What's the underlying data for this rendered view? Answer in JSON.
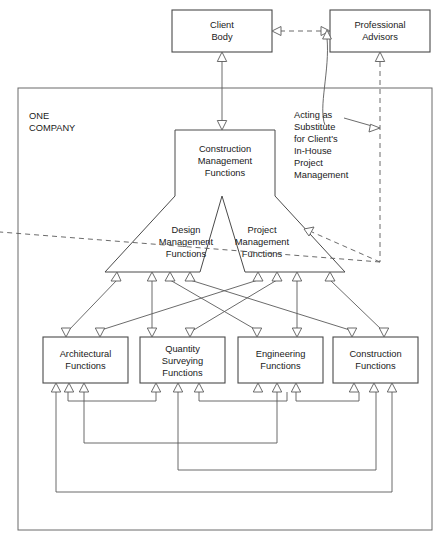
{
  "diagram": {
    "title_label": "ONE COMPANY",
    "frame": {
      "label_line1": "ONE",
      "label_line2": "COMPANY"
    },
    "top_boxes": [
      {
        "id": "client-body",
        "line1": "Client",
        "line2": "Body"
      },
      {
        "id": "professional-advisors",
        "line1": "Professional",
        "line2": "Advisors"
      }
    ],
    "central": {
      "head": {
        "line1": "Construction",
        "line2": "Management",
        "line3": "Functions"
      },
      "left_wing": {
        "line1": "Design",
        "line2": "Management",
        "line3": "Functions"
      },
      "right_wing": {
        "line1": "Project",
        "line2": "Management",
        "line3": "Functions"
      }
    },
    "annotation": {
      "lines": [
        "Acting as",
        "Substitute",
        "for Client's",
        "In-House",
        "Project",
        "Management"
      ]
    },
    "bottom_boxes": [
      {
        "id": "architectural",
        "line1": "Architectural",
        "line2": "Functions",
        "line3": ""
      },
      {
        "id": "quantity-surveying",
        "line1": "Quantity",
        "line2": "Surveying",
        "line3": "Functions"
      },
      {
        "id": "engineering",
        "line1": "Engineering",
        "line2": "Functions",
        "line3": ""
      },
      {
        "id": "construction",
        "line1": "Construction",
        "line2": "Functions",
        "line3": ""
      }
    ],
    "colors": {
      "stroke": "#4a4a4a",
      "connector": "#5a5a5a",
      "frame": "#6a6a6a",
      "background": "#ffffff",
      "text": "#1a1a1a"
    }
  }
}
